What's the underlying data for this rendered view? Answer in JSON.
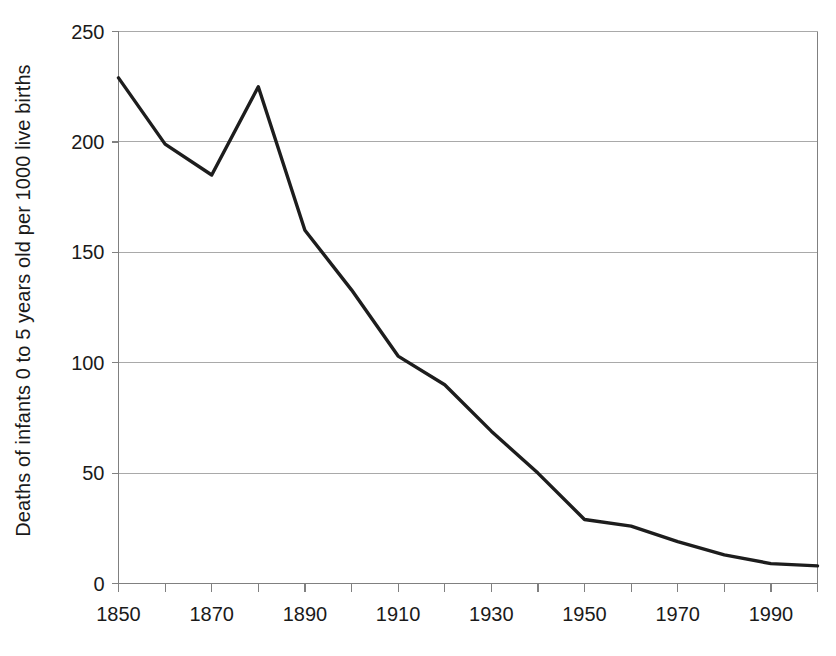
{
  "chart_data": {
    "type": "line",
    "title": "",
    "subtitle": "",
    "xlabel": "",
    "ylabel": "Deaths of infants 0 to 5 years old per 1000 live births",
    "xlim": [
      1850,
      2000
    ],
    "ylim": [
      0,
      250
    ],
    "grid": "horizontal",
    "legend": "none",
    "x_tick_interval": 10,
    "x_label_interval": 20,
    "y_ticks": [
      0,
      50,
      100,
      150,
      200,
      250
    ],
    "y_tick_labels": [
      "0",
      "50",
      "100",
      "150",
      "200",
      "250"
    ],
    "x_ticks": [
      1850,
      1860,
      1870,
      1880,
      1890,
      1900,
      1910,
      1920,
      1930,
      1940,
      1950,
      1960,
      1970,
      1980,
      1990,
      2000
    ],
    "x_tick_labels": [
      "1850",
      "",
      "1870",
      "",
      "1890",
      "",
      "1910",
      "",
      "1930",
      "",
      "1950",
      "",
      "1970",
      "",
      "1990",
      ""
    ],
    "x_labeled_ticks": [
      "1850",
      "1870",
      "1890",
      "1910",
      "1930",
      "1950",
      "1970",
      "1990"
    ],
    "series": [
      {
        "name": "Deaths of infants 0 to 5 years old per 1000 live births",
        "color": "#1d1d1d",
        "x": [
          1850,
          1860,
          1870,
          1880,
          1890,
          1900,
          1910,
          1920,
          1930,
          1940,
          1950,
          1960,
          1970,
          1980,
          1990,
          2000
        ],
        "values": [
          229,
          199,
          185,
          225,
          160,
          133,
          103,
          90,
          69,
          50,
          29,
          26,
          19,
          13,
          9,
          8
        ]
      }
    ]
  }
}
